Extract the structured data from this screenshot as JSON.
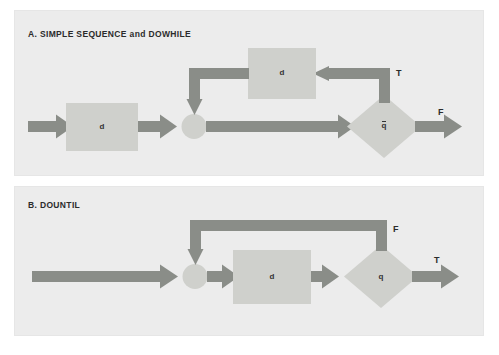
{
  "figure": {
    "background_color": "#ffffff",
    "panel_background": "#ececec",
    "shape_fill": "#cfd0cc",
    "arrow_color": "#8a8d88",
    "text_color": "#2b2b2b"
  },
  "panels": [
    {
      "id": "a",
      "title": "A. SIMPLE SEQUENCE and DOWHILE",
      "nodes": [
        {
          "name": "process-box-d-left",
          "type": "process",
          "label": "d",
          "overbar": false
        },
        {
          "name": "junction-circle",
          "type": "junction",
          "label": "",
          "overbar": false
        },
        {
          "name": "process-box-d-top",
          "type": "process",
          "label": "d",
          "overbar": false
        },
        {
          "name": "decision-diamond-qbar",
          "type": "decision",
          "label": "q",
          "overbar": true
        }
      ],
      "branch_labels": [
        {
          "name": "branch-label-true",
          "label": "T"
        },
        {
          "name": "branch-label-false",
          "label": "F"
        }
      ]
    },
    {
      "id": "b",
      "title": "B. DOUNTIL",
      "nodes": [
        {
          "name": "junction-circle",
          "type": "junction",
          "label": "",
          "overbar": false
        },
        {
          "name": "process-box-d",
          "type": "process",
          "label": "d",
          "overbar": false
        },
        {
          "name": "decision-diamond-q",
          "type": "decision",
          "label": "q",
          "overbar": false
        }
      ],
      "branch_labels": [
        {
          "name": "branch-label-false",
          "label": "F"
        },
        {
          "name": "branch-label-true",
          "label": "T"
        }
      ]
    }
  ]
}
